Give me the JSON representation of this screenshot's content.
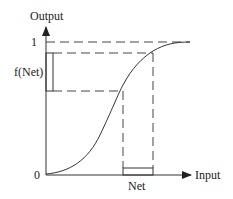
{
  "diagram": {
    "type": "sigmoid activation function",
    "y_axis": {
      "label": "Output",
      "ticks": [
        "1",
        "0"
      ]
    },
    "x_axis": {
      "label": "Input"
    },
    "annotations": {
      "f_net_label": "f(Net)",
      "net_label": "Net"
    },
    "colors": {
      "line": "#333333",
      "background": "#ffffff"
    }
  }
}
